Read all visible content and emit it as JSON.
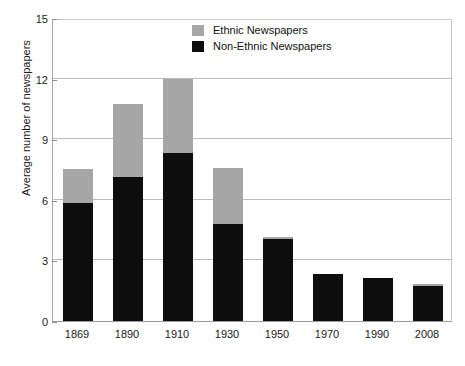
{
  "chart_data": {
    "type": "bar",
    "subtype": "stacked-vertical",
    "title": "",
    "xlabel": "",
    "ylabel": "Average number of newspapers",
    "ylim": [
      0,
      15
    ],
    "yticks": [
      0,
      3,
      6,
      9,
      12,
      15
    ],
    "ytick_labels": [
      "0",
      "3",
      "6",
      "9",
      "12",
      "15"
    ],
    "grid": true,
    "grid_axis": "y",
    "legend_position": "top-center",
    "categories": [
      "1869",
      "1890",
      "1910",
      "1930",
      "1950",
      "1970",
      "1990",
      "2008"
    ],
    "series": [
      {
        "name": "Non-Ethnic Newspapers",
        "color": "#0d0d0d",
        "values": [
          5.85,
          7.15,
          8.3,
          4.8,
          4.05,
          2.35,
          2.15,
          1.75
        ]
      },
      {
        "name": "Ethnic Newspapers",
        "color": "#a6a6a6",
        "values": [
          1.7,
          3.6,
          3.7,
          2.8,
          0.1,
          0,
          0,
          0.08
        ]
      }
    ],
    "totals": [
      7.55,
      10.75,
      12.0,
      7.6,
      4.15,
      2.35,
      2.15,
      1.83
    ]
  },
  "legend": {
    "items": [
      {
        "label": "Ethnic Newspapers",
        "color": "#a6a6a6",
        "swatch": "ethnic"
      },
      {
        "label": "Non-Ethnic Newspapers",
        "color": "#0d0d0d",
        "swatch": "nonethnic"
      }
    ]
  },
  "axes": {
    "y_title": "Average number of newspapers"
  },
  "colors": {
    "ethnic": "#a6a6a6",
    "non_ethnic": "#0d0d0d",
    "gridline": "#bdbdbd",
    "axis": "#9a9a9a",
    "text": "#1a1a1a",
    "background": "#ffffff"
  }
}
